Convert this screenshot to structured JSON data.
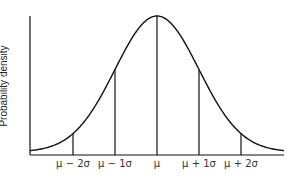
{
  "chart_data": {
    "type": "line",
    "title": "",
    "xlabel": "",
    "ylabel": "Probability density",
    "x_ticks": [
      "μ − 2σ",
      "μ − 1σ",
      "μ",
      "μ + 1σ",
      "μ + 2σ"
    ],
    "x_tick_values_sigma": [
      -2,
      -1,
      0,
      1,
      2
    ],
    "series": [
      {
        "name": "Normal distribution curve",
        "x_sigma": [
          -3,
          -2.5,
          -2,
          -1.5,
          -1,
          -0.5,
          0,
          0.5,
          1,
          1.5,
          2,
          2.5,
          3
        ],
        "y_relative": [
          0.011,
          0.044,
          0.135,
          0.325,
          0.607,
          0.882,
          1.0,
          0.882,
          0.607,
          0.325,
          0.135,
          0.044,
          0.011
        ]
      }
    ],
    "vertical_markers": [
      {
        "label": "μ − 2σ",
        "x_sigma": -2,
        "height_relative": 0.135
      },
      {
        "label": "μ − 1σ",
        "x_sigma": -1,
        "height_relative": 0.607
      },
      {
        "label": "μ",
        "x_sigma": 0,
        "height_relative": 1.0
      },
      {
        "label": "μ + 1σ",
        "x_sigma": 1,
        "height_relative": 0.607
      },
      {
        "label": "μ + 2σ",
        "x_sigma": 2,
        "height_relative": 0.135
      }
    ],
    "grid": false,
    "legend": "none",
    "line_color": "#111111"
  },
  "labels": {
    "ylabel": "Probability density",
    "ticks": [
      "μ − 2σ",
      "μ − 1σ",
      "μ",
      "μ + 1σ",
      "μ + 2σ"
    ]
  }
}
